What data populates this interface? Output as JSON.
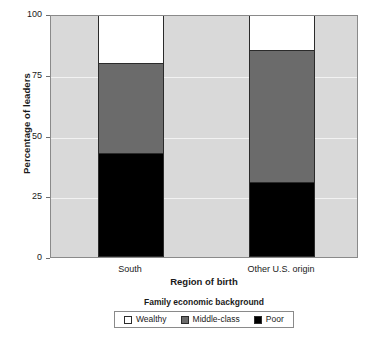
{
  "chart_data": {
    "type": "bar",
    "subtype": "stacked-bar",
    "title": "",
    "xlabel": "Region of birth",
    "ylabel": "Percentage of leaders",
    "categories": [
      "South",
      "Other U.S. origin"
    ],
    "series": [
      {
        "name": "Poor",
        "values": [
          43,
          31
        ],
        "color": "#000000"
      },
      {
        "name": "Middle-class",
        "values": [
          37,
          54
        ],
        "color": "#6b6b6b"
      },
      {
        "name": "Wealthy",
        "values": [
          20,
          15
        ],
        "color": "#ffffff"
      }
    ],
    "stack_tops": {
      "Poor": [
        43,
        31
      ],
      "Middle-class": [
        80,
        85
      ],
      "Wealthy": [
        100,
        100
      ]
    },
    "ylim": [
      0,
      100
    ],
    "yticks": [
      0,
      25,
      50,
      75,
      100
    ],
    "ytick_labels": [
      "0",
      "25",
      "50",
      "75",
      "100"
    ],
    "grid": true,
    "grid_color": "#f2f2f2",
    "plot_background": "#d9d9d9",
    "legend_position": "bottom",
    "legend_title": "Family economic background",
    "legend_entries": [
      "Wealthy",
      "Middle-class",
      "Poor"
    ]
  },
  "axes": {
    "y_title": "Percentage of leaders",
    "x_title": "Region of birth",
    "y_ticks": [
      {
        "label": "100",
        "value": 100
      },
      {
        "label": "75",
        "value": 75
      },
      {
        "label": "50",
        "value": 50
      },
      {
        "label": "25",
        "value": 25
      },
      {
        "label": "0",
        "value": 0
      }
    ],
    "x_ticks": [
      {
        "label": "South"
      },
      {
        "label": "Other U.S. origin"
      }
    ]
  },
  "legend": {
    "title": "Family economic background",
    "items": [
      {
        "label": "Wealthy",
        "color": "#ffffff"
      },
      {
        "label": "Middle-class",
        "color": "#6b6b6b"
      },
      {
        "label": "Poor",
        "color": "#000000"
      }
    ]
  }
}
